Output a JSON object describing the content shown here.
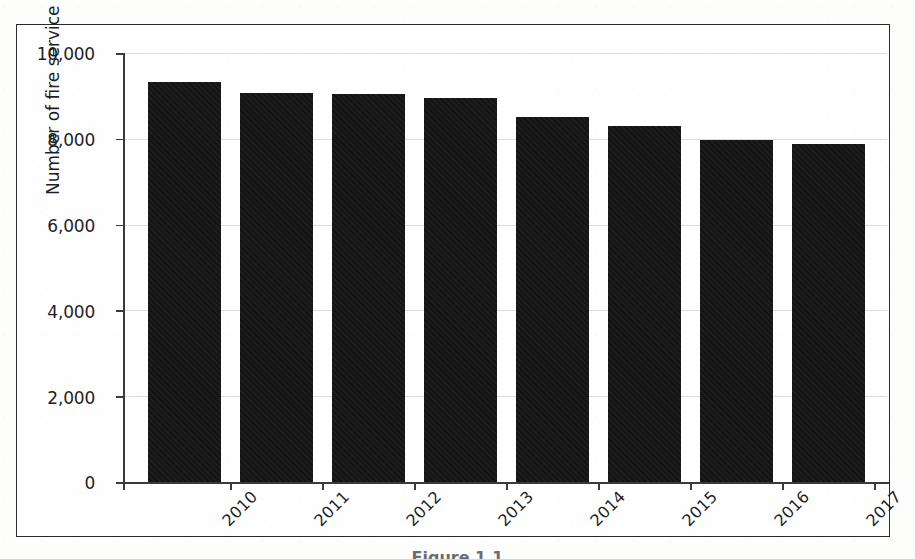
{
  "figure": {
    "background_color": "#fdfdfc",
    "frame_color": "#2a2a2a",
    "caption_fragment": "Figure 1.1",
    "y_axis_title": "Number of fire service staff"
  },
  "chart_data": {
    "type": "bar",
    "title": "",
    "subtitle": "",
    "xlabel": "",
    "ylabel": "Number of fire service staff",
    "categories": [
      "2010",
      "2011",
      "2012",
      "2013",
      "2014",
      "2015",
      "2016",
      "2017"
    ],
    "values": [
      9320,
      9070,
      9050,
      8960,
      8520,
      8290,
      7980,
      7880
    ],
    "series": [
      {
        "name": "Number of fire service staff",
        "values": [
          9320,
          9070,
          9050,
          8960,
          8520,
          8290,
          7980,
          7880
        ],
        "color": "#141414"
      }
    ],
    "ylim": [
      0,
      10000
    ],
    "y_ticks": [
      0,
      2000,
      4000,
      6000,
      8000,
      10000
    ],
    "y_tick_labels": [
      "0",
      "2,000",
      "4,000",
      "6,000",
      "8,000",
      "10,000"
    ],
    "x_tick_labels": [
      "2010",
      "2011",
      "2012",
      "2013",
      "2014",
      "2015",
      "2016",
      "2017"
    ],
    "x_tick_label_rotation": -45,
    "grid": true,
    "grid_color": "#dcdcdc",
    "grid_axis": "y",
    "legend": false,
    "legend_position": "none",
    "bar_color": "#141414",
    "annotations": []
  }
}
